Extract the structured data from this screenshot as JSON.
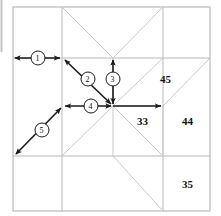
{
  "figure": {
    "canvas": {
      "width": 221,
      "height": 216
    },
    "colors": {
      "background": "#ffffff",
      "grid_line": "#b9b9b9",
      "block_line": "#c9c9c9",
      "arrow": "#1a1a1a",
      "label_text": "#141414",
      "callout_text": "#111111"
    },
    "region_labels": [
      {
        "id": "region-45",
        "text": "45",
        "x": 166,
        "y": 80
      },
      {
        "id": "region-33",
        "text": "33",
        "x": 143,
        "y": 122
      },
      {
        "id": "region-44",
        "text": "44",
        "x": 188,
        "y": 122
      },
      {
        "id": "region-35",
        "text": "35",
        "x": 188,
        "y": 185
      }
    ],
    "callouts": [
      {
        "id": "callout-1",
        "text": "1",
        "cx": 38,
        "cy": 58
      },
      {
        "id": "callout-2",
        "text": "2",
        "cx": 88,
        "cy": 79
      },
      {
        "id": "callout-3",
        "text": "3",
        "cx": 113,
        "cy": 79
      },
      {
        "id": "callout-4",
        "text": "4",
        "cx": 91,
        "cy": 106
      },
      {
        "id": "callout-5",
        "text": "5",
        "cx": 42,
        "cy": 130
      }
    ],
    "arrows": [
      {
        "id": "arrow-1",
        "label": "1",
        "kind": "double",
        "x1": 13,
        "y1": 58,
        "x2": 62,
        "y2": 58
      },
      {
        "id": "arrow-2",
        "label": "2",
        "kind": "double",
        "x1": 63,
        "y1": 58,
        "x2": 113,
        "y2": 106
      },
      {
        "id": "arrow-3",
        "label": "3",
        "kind": "double",
        "x1": 113,
        "y1": 58,
        "x2": 113,
        "y2": 106
      },
      {
        "id": "arrow-4",
        "label": "4",
        "kind": "double",
        "x1": 63,
        "y1": 106,
        "x2": 113,
        "y2": 106
      },
      {
        "id": "arrow-5",
        "label": "5",
        "kind": "double",
        "x1": 14,
        "y1": 156,
        "x2": 63,
        "y2": 106
      },
      {
        "id": "arrow-6",
        "label": "",
        "kind": "single",
        "x1": 113,
        "y1": 106,
        "x2": 163,
        "y2": 106
      }
    ],
    "grid": {
      "outer": {
        "left": 13,
        "top": 7,
        "right": 210,
        "bottom": 211
      },
      "verticals": [
        62,
        163
      ],
      "horizontals": [
        58,
        156
      ],
      "center": {
        "x": 113,
        "y": 106
      }
    }
  }
}
